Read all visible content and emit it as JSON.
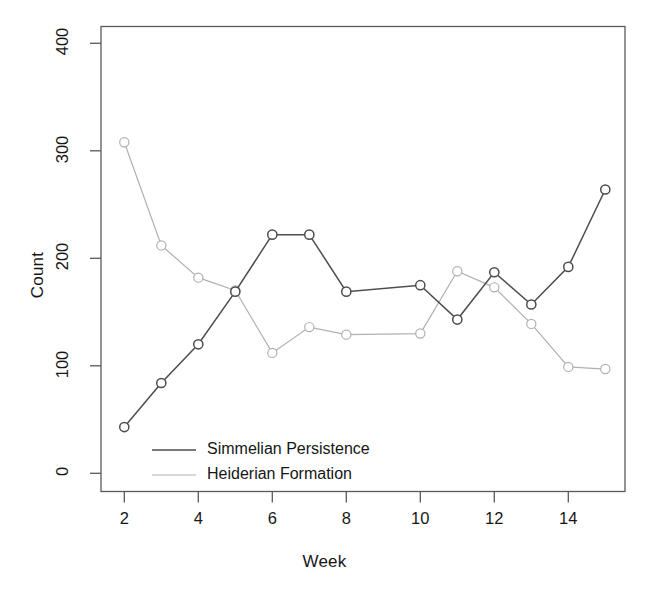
{
  "chart_data": {
    "type": "line",
    "title": "",
    "xlabel": "Week",
    "ylabel": "Count",
    "x": [
      2,
      3,
      4,
      5,
      6,
      7,
      8,
      10,
      11,
      12,
      13,
      14,
      15
    ],
    "xlim": [
      1.6,
      15.4
    ],
    "ylim": [
      -18,
      418
    ],
    "xticks": [
      2,
      4,
      6,
      8,
      10,
      12,
      14
    ],
    "xtick_labels": [
      "2",
      "4",
      "6",
      "8",
      "10",
      "12",
      "14"
    ],
    "yticks": [
      0,
      100,
      200,
      300,
      400
    ],
    "ytick_labels": [
      "0",
      "100",
      "200",
      "300",
      "400"
    ],
    "grid": false,
    "legend_position": "bottom-left",
    "marker": "open-circle",
    "series": [
      {
        "name": "Simmelian Persistence",
        "color": "#4d4d4d",
        "x": [
          2,
          3,
          4,
          5,
          6,
          7,
          8,
          10,
          11,
          12,
          13,
          14,
          15
        ],
        "values": [
          43,
          84,
          120,
          169,
          222,
          222,
          169,
          175,
          143,
          187,
          157,
          192,
          264
        ]
      },
      {
        "name": "Heiderian Formation",
        "color": "#b0b0b0",
        "x": [
          2,
          3,
          4,
          5,
          6,
          7,
          8,
          10,
          11,
          12,
          13,
          14,
          15
        ],
        "values": [
          308,
          212,
          182,
          170,
          112,
          136,
          129,
          130,
          188,
          173,
          139,
          99,
          97
        ]
      }
    ]
  },
  "legend": {
    "entries": [
      {
        "label": "Simmelian Persistence",
        "color": "#4d4d4d"
      },
      {
        "label": "Heiderian Formation",
        "color": "#b0b0b0"
      }
    ]
  },
  "axes": {
    "x_title": "Week",
    "y_title": "Count",
    "box_color": "#595959",
    "tick_color": "#595959"
  }
}
